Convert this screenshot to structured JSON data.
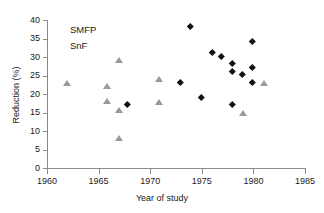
{
  "chart_data": {
    "type": "scatter",
    "title": "",
    "xlabel": "Year of study",
    "ylabel": "Reduction (%)",
    "xlim": [
      1960,
      1985
    ],
    "ylim": [
      0,
      40
    ],
    "xticks": [
      1960,
      1965,
      1970,
      1975,
      1980,
      1985
    ],
    "yticks": [
      0,
      5,
      10,
      15,
      20,
      25,
      30,
      35,
      40
    ],
    "grid": false,
    "legend_position": "top-left",
    "series": [
      {
        "name": "SMFP",
        "marker": "diamond",
        "color": "#111111",
        "points": [
          {
            "x": 1967.9,
            "y": 17
          },
          {
            "x": 1973.0,
            "y": 23
          },
          {
            "x": 1974.0,
            "y": 38
          },
          {
            "x": 1975.0,
            "y": 19
          },
          {
            "x": 1976.1,
            "y": 31
          },
          {
            "x": 1977.0,
            "y": 30
          },
          {
            "x": 1978.0,
            "y": 28
          },
          {
            "x": 1978.0,
            "y": 26
          },
          {
            "x": 1978.0,
            "y": 17
          },
          {
            "x": 1979.0,
            "y": 25
          },
          {
            "x": 1980.0,
            "y": 34
          },
          {
            "x": 1980.0,
            "y": 27
          },
          {
            "x": 1980.0,
            "y": 23
          }
        ]
      },
      {
        "name": "SnF",
        "marker": "triangle",
        "color": "#9a9a9a",
        "points": [
          {
            "x": 1961.9,
            "y": 23
          },
          {
            "x": 1965.8,
            "y": 22
          },
          {
            "x": 1965.8,
            "y": 18
          },
          {
            "x": 1967.0,
            "y": 29
          },
          {
            "x": 1967.0,
            "y": 15.5
          },
          {
            "x": 1967.0,
            "y": 8
          },
          {
            "x": 1970.9,
            "y": 24
          },
          {
            "x": 1970.9,
            "y": 17.8
          },
          {
            "x": 1979.0,
            "y": 14.7
          },
          {
            "x": 1981.0,
            "y": 23
          }
        ]
      }
    ]
  },
  "legend": {
    "entries": [
      {
        "label": "SMFP",
        "marker": "diamond"
      },
      {
        "label": "SnF",
        "marker": "triangle"
      }
    ]
  }
}
